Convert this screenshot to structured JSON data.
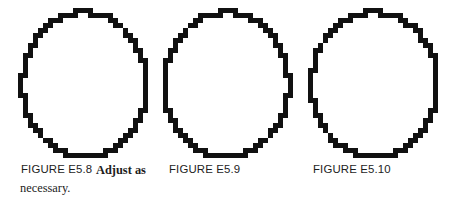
{
  "page": {
    "width": 457,
    "height": 215,
    "background": "#ffffff",
    "ink_color": "#111111"
  },
  "figures": [
    {
      "id": "figure-e5-8",
      "shape": "circle-outline-pixelated",
      "label": "FIGURE E5.8",
      "caption": "Adjust as",
      "caption_continued": "necessary.",
      "center_x": 84,
      "center_y": 84,
      "radius_x": 62,
      "radius_y": 72,
      "stroke": 5
    },
    {
      "id": "figure-e5-9",
      "shape": "circle-outline-pixelated",
      "label": "FIGURE E5.9",
      "caption": "",
      "caption_continued": "",
      "center_x": 226,
      "center_y": 84,
      "radius_x": 62,
      "radius_y": 72,
      "stroke": 5
    },
    {
      "id": "figure-e5-10",
      "shape": "circle-outline-pixelated",
      "label": "FIGURE E5.10",
      "caption": "",
      "caption_continued": "",
      "center_x": 374,
      "center_y": 84,
      "radius_x": 63,
      "radius_y": 72,
      "stroke": 5
    }
  ],
  "captions": {
    "figure_1_label": "FIGURE E5.8",
    "figure_1_text": "Adjust as",
    "figure_1_text_line2": "necessary.",
    "figure_2_label": "FIGURE E5.9",
    "figure_3_label": "FIGURE E5.10"
  }
}
